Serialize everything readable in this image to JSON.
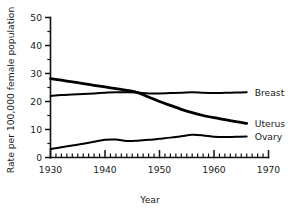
{
  "chart_data": {
    "type": "line",
    "title": "",
    "xlabel": "Year",
    "ylabel": "Rate per 100,000 female population",
    "xlim": [
      1930,
      1970
    ],
    "ylim": [
      0,
      50
    ],
    "grid": false,
    "legend_position": "right-inline",
    "x_ticks_major": [
      1930,
      1940,
      1950,
      1960,
      1970
    ],
    "x_tick_labels": [
      "1930",
      "1940",
      "1950",
      "1960",
      "1970"
    ],
    "x_minor_tick_step": 1,
    "y_ticks_major": [
      0,
      10,
      20,
      30,
      40,
      50
    ],
    "y_tick_labels": [
      "0",
      "10",
      "20",
      "30",
      "40",
      "50"
    ],
    "y_minor_tick_step": 5,
    "series": [
      {
        "name": "Breast",
        "label": "Breast",
        "line_width": 2.0,
        "x": [
          1930,
          1932,
          1934,
          1936,
          1938,
          1940,
          1942,
          1944,
          1946,
          1948,
          1950,
          1952,
          1954,
          1956,
          1958,
          1960,
          1962,
          1964,
          1966
        ],
        "values": [
          22.0,
          22.3,
          22.5,
          22.7,
          22.9,
          23.1,
          23.3,
          23.3,
          23.2,
          22.9,
          22.9,
          23.0,
          23.1,
          23.3,
          23.1,
          23.0,
          23.1,
          23.2,
          23.3
        ]
      },
      {
        "name": "Uterus",
        "label": "Uterus",
        "line_width": 2.8,
        "x": [
          1930,
          1932,
          1934,
          1936,
          1938,
          1940,
          1942,
          1944,
          1946,
          1948,
          1950,
          1952,
          1954,
          1956,
          1958,
          1960,
          1962,
          1964,
          1966
        ],
        "values": [
          28.2,
          27.6,
          27.0,
          26.4,
          25.8,
          25.2,
          24.6,
          24.0,
          23.2,
          21.6,
          20.0,
          18.6,
          17.2,
          16.0,
          15.0,
          14.2,
          13.5,
          12.8,
          12.2
        ]
      },
      {
        "name": "Ovary",
        "label": "Ovary",
        "line_width": 2.0,
        "x": [
          1930,
          1932,
          1934,
          1936,
          1938,
          1940,
          1942,
          1944,
          1946,
          1948,
          1950,
          1952,
          1954,
          1956,
          1958,
          1960,
          1962,
          1964,
          1966
        ],
        "values": [
          3.0,
          3.7,
          4.3,
          4.9,
          5.6,
          6.3,
          6.4,
          5.9,
          6.0,
          6.3,
          6.7,
          7.1,
          7.6,
          8.1,
          7.9,
          7.4,
          7.3,
          7.4,
          7.5
        ]
      }
    ],
    "colors": {
      "axis": "#111111",
      "line": "#000000",
      "text": "#1a1a1a",
      "background": "#ffffff"
    }
  }
}
